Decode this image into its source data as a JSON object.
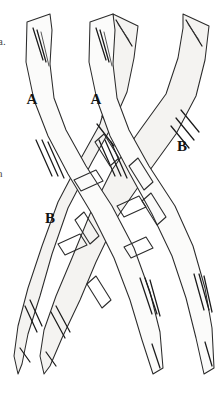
{
  "figure": {
    "background_color": "#ffffff",
    "stroke_color": "#2b2b2b",
    "fill_color": "#fbfbfa",
    "shaded_fill_color": "#f4f3f1",
    "width": 219,
    "height": 396
  },
  "margin_text": {
    "top_fragment": "a.",
    "bottom_fragment": "h"
  },
  "labels": [
    {
      "id": "label-a-left",
      "text": "A",
      "x": 32,
      "y": 101
    },
    {
      "id": "label-a-right",
      "text": "A",
      "x": 96,
      "y": 101
    },
    {
      "id": "label-b-right",
      "text": "B",
      "x": 182,
      "y": 148
    },
    {
      "id": "label-b-left",
      "text": "B",
      "x": 50,
      "y": 220
    }
  ],
  "bundles": [
    {
      "id": "bundle-1",
      "label": "A",
      "origin": "upper-left",
      "insertion": "lower-right"
    },
    {
      "id": "bundle-2",
      "label": "A",
      "origin": "upper-mid-left",
      "insertion": "lower-mid-right"
    },
    {
      "id": "bundle-3",
      "label": "B",
      "origin": "upper-mid-right",
      "insertion": "lower-mid-left"
    },
    {
      "id": "bundle-4",
      "label": "B",
      "origin": "upper-right",
      "insertion": "lower-left"
    }
  ],
  "crossing_region": {
    "description": "central decussation zone with rhomboid striation blocks",
    "block_count": 9
  }
}
